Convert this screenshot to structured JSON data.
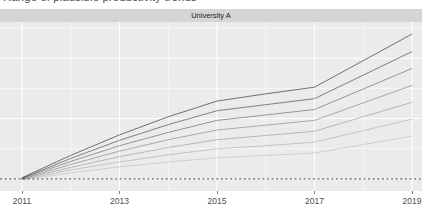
{
  "chart_data": {
    "type": "line",
    "title": "Range of plausible productivity trends",
    "facet_label": "University A",
    "xlabel": "",
    "ylabel": "",
    "xlim": [
      2011,
      2019
    ],
    "ylim": [
      -0.2,
      2.6
    ],
    "x_tick_labels": [
      "2011",
      "2013",
      "2015",
      "2017",
      "2019"
    ],
    "x_ticks": [
      2011,
      2013,
      2015,
      2017,
      2019
    ],
    "y_tick_labels": [],
    "grid": true,
    "legend_position": "none",
    "panel_background": "#ebebeb",
    "gridline_color": "#ffffff",
    "line_color": "#595959",
    "reference_line": {
      "type": "horizontal",
      "value": 0,
      "style": "dashed",
      "color": "#4d4d4d",
      "label": ""
    },
    "x": [
      2011,
      2012,
      2013,
      2014,
      2015,
      2016,
      2017,
      2018,
      2019
    ],
    "series": [
      {
        "name": "scenario-1",
        "opacity": 0.95,
        "values": [
          0.02,
          0.39,
          0.73,
          1.03,
          1.29,
          1.41,
          1.52,
          1.96,
          2.4
        ]
      },
      {
        "name": "scenario-2",
        "opacity": 0.82,
        "values": [
          0.01,
          0.34,
          0.64,
          0.9,
          1.13,
          1.23,
          1.33,
          1.72,
          2.11
        ]
      },
      {
        "name": "scenario-3",
        "opacity": 0.66,
        "values": [
          0.01,
          0.29,
          0.55,
          0.77,
          0.97,
          1.06,
          1.15,
          1.49,
          1.83
        ]
      },
      {
        "name": "scenario-4",
        "opacity": 0.52,
        "values": [
          0.0,
          0.24,
          0.46,
          0.65,
          0.81,
          0.89,
          0.97,
          1.26,
          1.55
        ]
      },
      {
        "name": "scenario-5",
        "opacity": 0.4,
        "values": [
          0.0,
          0.19,
          0.37,
          0.52,
          0.65,
          0.72,
          0.79,
          1.03,
          1.27
        ]
      },
      {
        "name": "scenario-6",
        "opacity": 0.3,
        "values": [
          -0.01,
          0.15,
          0.28,
          0.4,
          0.5,
          0.55,
          0.61,
          0.8,
          0.99
        ]
      },
      {
        "name": "scenario-7",
        "opacity": 0.22,
        "values": [
          -0.01,
          0.1,
          0.2,
          0.28,
          0.35,
          0.39,
          0.43,
          0.57,
          0.71
        ]
      }
    ]
  }
}
